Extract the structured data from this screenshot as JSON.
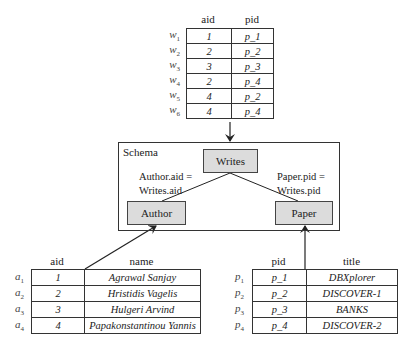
{
  "writes_table": {
    "headers": [
      "aid",
      "pid"
    ],
    "rows": [
      {
        "label": "w",
        "sub": "1",
        "aid": "1",
        "pid": "p_1"
      },
      {
        "label": "w",
        "sub": "2",
        "aid": "2",
        "pid": "p_2"
      },
      {
        "label": "w",
        "sub": "3",
        "aid": "3",
        "pid": "p_3"
      },
      {
        "label": "w",
        "sub": "4",
        "aid": "2",
        "pid": "p_4"
      },
      {
        "label": "w",
        "sub": "5",
        "aid": "4",
        "pid": "p_2"
      },
      {
        "label": "w",
        "sub": "6",
        "aid": "4",
        "pid": "p_4"
      }
    ]
  },
  "schema": {
    "title": "Schema",
    "nodes": {
      "writes": "Writes",
      "author": "Author",
      "paper": "Paper"
    },
    "edges": {
      "author_writes_line1": "Author.aid =",
      "author_writes_line2": "Writes.aid",
      "paper_writes_line1": "Paper.pid =",
      "paper_writes_line2": "Writes.pid"
    }
  },
  "author_table": {
    "headers": [
      "aid",
      "name"
    ],
    "rows": [
      {
        "label": "a",
        "sub": "1",
        "aid": "1",
        "name": "Agrawal Sanjay"
      },
      {
        "label": "a",
        "sub": "2",
        "aid": "2",
        "name": "Hristidis Vagelis"
      },
      {
        "label": "a",
        "sub": "3",
        "aid": "3",
        "name": "Hulgeri Arvind"
      },
      {
        "label": "a",
        "sub": "4",
        "aid": "4",
        "name": "Papakonstantinou Yannis"
      }
    ]
  },
  "paper_table": {
    "headers": [
      "pid",
      "title"
    ],
    "rows": [
      {
        "label": "p",
        "sub": "1",
        "pid": "p_1",
        "title": "DBXplorer"
      },
      {
        "label": "p",
        "sub": "2",
        "pid": "p_2",
        "title": "DISCOVER-1"
      },
      {
        "label": "p",
        "sub": "3",
        "pid": "p_3",
        "title": "BANKS"
      },
      {
        "label": "p",
        "sub": "4",
        "pid": "p_4",
        "title": "DISCOVER-2"
      }
    ]
  }
}
